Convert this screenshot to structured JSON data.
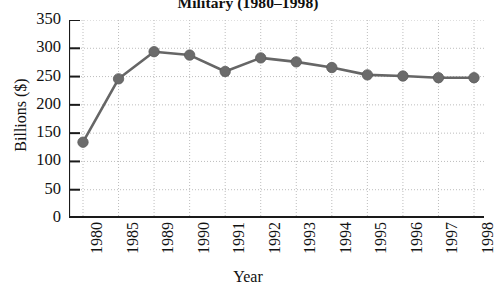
{
  "chart_data": {
    "type": "line",
    "title": "Military (1980–1998)",
    "xlabel": "Year",
    "ylabel": "Billions ($)",
    "categories": [
      "1980",
      "1985",
      "1989",
      "1990",
      "1991",
      "1992",
      "1993",
      "1994",
      "1995",
      "1996",
      "1997",
      "1998"
    ],
    "values": [
      134,
      246,
      294,
      288,
      259,
      283,
      276,
      266,
      253,
      251,
      248,
      248
    ],
    "series": [
      {
        "name": "Military spending",
        "values": [
          134,
          246,
          294,
          288,
          259,
          283,
          276,
          266,
          253,
          251,
          248,
          248
        ]
      }
    ],
    "ylim": [
      0,
      350
    ],
    "yticks": [
      "0",
      "50",
      "100",
      "150",
      "200",
      "250",
      "300",
      "350"
    ],
    "ytick_values": [
      0,
      50,
      100,
      150,
      200,
      250,
      300,
      350
    ],
    "grid": "dotted",
    "legend": "none",
    "marker": "filled-circle",
    "line_color": "#666666",
    "marker_color": "#6b6b6b",
    "axis_color": "#1a1a1a",
    "grid_color": "#bdbdbd",
    "background": "#ffffff"
  }
}
